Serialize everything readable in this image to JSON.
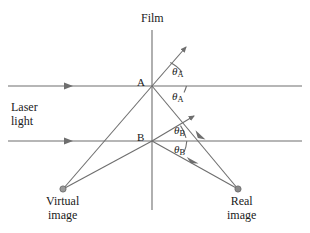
{
  "figure": {
    "type": "optics-ray-diagram",
    "title_label": "Film",
    "background_color": "#ffffff",
    "line_color": "#6e6e6e",
    "text_color": "#1a1a1a",
    "dot_color": "#8a8a8a"
  },
  "labels": {
    "film": "Film",
    "point_a": "A",
    "point_b": "B",
    "laser_line1": "Laser",
    "laser_line2": "light",
    "virtual_line1": "Virtual",
    "virtual_line2": "image",
    "real_line1": "Real",
    "real_line2": "image",
    "theta_symbol": "θ",
    "theta_a_sub": "A",
    "theta_b_sub": "B"
  },
  "angles": [
    {
      "name": "theta-a-upper",
      "symbol": "θ",
      "subscript": "A",
      "x": 172,
      "y": 65
    },
    {
      "name": "theta-a-lower",
      "symbol": "θ",
      "subscript": "A",
      "x": 172,
      "y": 90
    },
    {
      "name": "theta-b-upper",
      "symbol": "θ",
      "subscript": "B",
      "x": 174,
      "y": 124
    },
    {
      "name": "theta-b-lower",
      "symbol": "θ",
      "subscript": "B",
      "x": 174,
      "y": 143
    }
  ],
  "geometry": {
    "film_line": {
      "x": 152,
      "y_top": 30,
      "y_bottom": 210
    },
    "point_a": {
      "x": 152,
      "y": 86
    },
    "point_b": {
      "x": 152,
      "y": 141
    },
    "laser_beam_upper": {
      "x_start": 8,
      "x_end": 302,
      "y": 86,
      "arrow_x": 70
    },
    "laser_beam_lower": {
      "x_start": 8,
      "x_end": 302,
      "y": 141,
      "arrow_x": 70
    },
    "virtual_image_dot": {
      "x": 63,
      "y": 189
    },
    "real_image_dot": {
      "x": 238,
      "y": 189
    },
    "ray_a_diffracted_up_end": {
      "x": 186,
      "y": 47
    },
    "ray_b_diffracted_up_end": {
      "x": 194,
      "y": 116
    }
  }
}
